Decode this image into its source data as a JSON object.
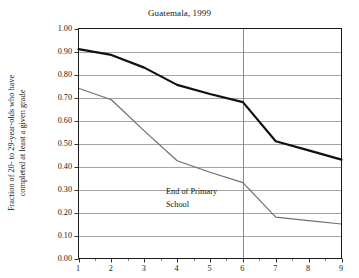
{
  "chart_data": {
    "type": "line",
    "title": "Guatemala, 1999",
    "xlabel": "",
    "ylabel": "Fraction of 20- to 29-year-olds who have completed at least a given grade",
    "ylabel_lines": [
      "Fraction of 20- to 29-year-olds who have",
      "completed at least a given grade"
    ],
    "categories": [
      1,
      2,
      3,
      4,
      5,
      6,
      7,
      8,
      9
    ],
    "x": [
      1,
      2,
      3,
      4,
      5,
      6,
      7,
      8,
      9
    ],
    "xlim": [
      1,
      9
    ],
    "ylim": [
      0.0,
      1.0
    ],
    "ytick_labels": [
      "0.00",
      "0.10",
      "0.20",
      "0.30",
      "0.40",
      "0.50",
      "0.60",
      "0.70",
      "0.80",
      "0.90",
      "1.00"
    ],
    "ytick_values": [
      0.0,
      0.1,
      0.2,
      0.3,
      0.4,
      0.5,
      0.6,
      0.7,
      0.8,
      0.9,
      1.0
    ],
    "xtick_labels": [
      "1",
      "2",
      "3",
      "4",
      "5",
      "6",
      "7",
      "8",
      "9"
    ],
    "grid": true,
    "grid_axis": "y",
    "legend": false,
    "legend_position": "none",
    "series": [
      {
        "name": "upper",
        "color": "#111111",
        "width": 2.2,
        "values": [
          0.91,
          0.885,
          0.83,
          0.755,
          0.715,
          0.68,
          0.51,
          0.47,
          0.43
        ]
      },
      {
        "name": "lower",
        "color": "#6e6e6e",
        "width": 1.2,
        "values": [
          0.74,
          0.69,
          0.555,
          0.425,
          0.375,
          0.33,
          0.18,
          0.165,
          0.15
        ]
      }
    ],
    "annotations": [
      {
        "text": "End of Primary School",
        "lines": [
          "End of Primary",
          "School"
        ],
        "x": 4.8,
        "y": 0.24
      }
    ],
    "reference_lines": [
      {
        "orientation": "vertical",
        "x": 6,
        "color": "#8a8a8a"
      }
    ],
    "colors": {
      "axis": "#1a1a1a",
      "grid": "#9a9a9a",
      "upper_series": "#111111",
      "lower_series": "#6e6e6e",
      "reference_line": "#8a8a8a",
      "background": "#ffffff"
    }
  }
}
